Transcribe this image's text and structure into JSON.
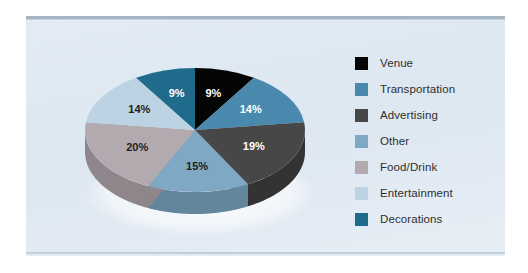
{
  "panel": {
    "background_color": "#dfe8f2",
    "border_color": "#9aabbb"
  },
  "chart_data": {
    "type": "pie",
    "title": "",
    "subtitle": "",
    "xlabel": "",
    "ylabel": "",
    "legend_position": "right",
    "three_d": true,
    "start_angle_deg": 0,
    "direction": "clockwise",
    "units": "%",
    "categories": [
      "Venue",
      "Transportation",
      "Advertising",
      "Other",
      "Food/Drink",
      "Entertainment",
      "Decorations"
    ],
    "values": [
      9,
      14,
      19,
      15,
      20,
      14,
      9
    ],
    "labels": [
      "9%",
      "14%",
      "19%",
      "15%",
      "20%",
      "14%",
      "9%"
    ],
    "colors": [
      "#050505",
      "#4a89ae",
      "#474747",
      "#7fa8c4",
      "#b3aab0",
      "#bcd3e3",
      "#1f6b8c"
    ],
    "side_colors": [
      "#000000",
      "#3a6d8c",
      "#333333",
      "#63869d",
      "#8e868b",
      "#97aab8",
      "#175570"
    ],
    "label_text_colors": [
      "#ffffff",
      "#ffffff",
      "#ffffff",
      "#1d1d1d",
      "#1d1d1d",
      "#1d1d1d",
      "#ffffff"
    ]
  },
  "legend": {
    "items": [
      {
        "label": "Venue",
        "color": "#050505",
        "value": "9%"
      },
      {
        "label": "Transportation",
        "color": "#4a89ae",
        "value": "14%"
      },
      {
        "label": "Advertising",
        "color": "#474747",
        "value": "19%"
      },
      {
        "label": "Other",
        "color": "#7fa8c4",
        "value": "15%"
      },
      {
        "label": "Food/Drink",
        "color": "#b3aab0",
        "value": "20%"
      },
      {
        "label": "Entertainment",
        "color": "#bcd3e3",
        "value": "14%"
      },
      {
        "label": "Decorations",
        "color": "#1f6b8c",
        "value": "9%"
      }
    ]
  }
}
